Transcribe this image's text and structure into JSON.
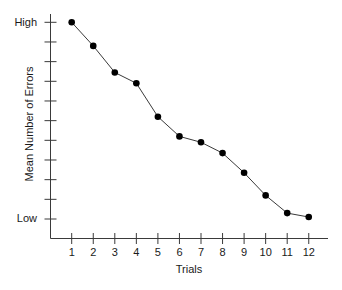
{
  "chart_data": {
    "type": "line",
    "title": "",
    "xlabel": "Trials",
    "ylabel": "Mean Number of Errors",
    "x": [
      1,
      2,
      3,
      4,
      5,
      6,
      7,
      8,
      9,
      10,
      11,
      12
    ],
    "categories": [
      "1",
      "2",
      "3",
      "4",
      "5",
      "6",
      "7",
      "8",
      "9",
      "10",
      "11",
      "12"
    ],
    "series": [
      {
        "name": "Mean Number of Errors",
        "values": [
          10.0,
          8.8,
          7.45,
          6.9,
          5.2,
          4.2,
          3.9,
          3.35,
          2.35,
          1.2,
          0.3,
          0.1
        ]
      }
    ],
    "y_scale_note": "Relative scale: 0 = Low, 10 = High (11 unlabeled ticks)",
    "ylim": [
      0,
      10
    ],
    "y_tick_labels": {
      "top": "High",
      "bottom": "Low"
    },
    "y_tick_count": 11,
    "grid": false,
    "legend": "none",
    "markers": "filled-circle"
  },
  "labels": {
    "y_high": "High",
    "y_low": "Low",
    "x_title": "Trials",
    "y_title": "Mean Number of Errors"
  },
  "colors": {
    "line": "#3a3a3a",
    "marker": "#000000",
    "axis": "#3a3a3a"
  }
}
